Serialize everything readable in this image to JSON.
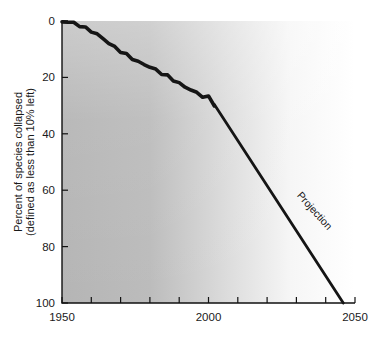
{
  "chart_data": {
    "type": "line",
    "title": "",
    "xlabel": "",
    "ylabel": "Percent of species collapsed (defined as less than 10% left)",
    "ylabel_line1": "Percent of species collapsed",
    "ylabel_line2": "(defined as less than 10% left)",
    "xlim": [
      1950,
      2050
    ],
    "ylim": [
      0,
      100
    ],
    "y_inverted": true,
    "grid": false,
    "legend": "none",
    "background": "horizontal gradient from gray to white",
    "x_ticks_major": [
      1950,
      2000,
      2050
    ],
    "x_tick_labels": [
      "1950",
      "2000",
      "2050"
    ],
    "x_ticks_minor": [
      1960,
      1970,
      1980,
      1990,
      2010,
      2020,
      2030,
      2040
    ],
    "y_ticks": [
      0,
      20,
      40,
      60,
      80,
      100
    ],
    "y_tick_labels": [
      "0",
      "20",
      "40",
      "60",
      "80",
      "100"
    ],
    "annotations": [
      {
        "text": "Projection",
        "x": 2030,
        "y": 62,
        "rotation": 48
      }
    ],
    "series": [
      {
        "name": "Historical",
        "style": "solid-thick-jagged",
        "x": [
          1950,
          1952,
          1954,
          1956,
          1958,
          1960,
          1962,
          1964,
          1966,
          1968,
          1970,
          1972,
          1974,
          1976,
          1978,
          1980,
          1982,
          1984,
          1986,
          1988,
          1990,
          1992,
          1994,
          1996,
          1998,
          2000,
          2002
        ],
        "values": [
          0.3,
          0.4,
          0.8,
          1.6,
          2.6,
          3.8,
          5.2,
          6.6,
          8.0,
          9.5,
          11.0,
          12.4,
          13.6,
          14.6,
          15.4,
          16.4,
          17.6,
          18.6,
          19.4,
          20.6,
          22.0,
          23.4,
          24.2,
          25.2,
          26.2,
          26.8,
          29.6
        ]
      },
      {
        "name": "Projection",
        "style": "solid-straight",
        "x": [
          2002,
          2046
        ],
        "values": [
          29.6,
          100
        ]
      }
    ]
  },
  "colors": {
    "line": "#151515",
    "axis": "#111111",
    "text": "#1a1a1a",
    "bg_left": "#b5b5b5",
    "bg_right": "#ffffff"
  }
}
